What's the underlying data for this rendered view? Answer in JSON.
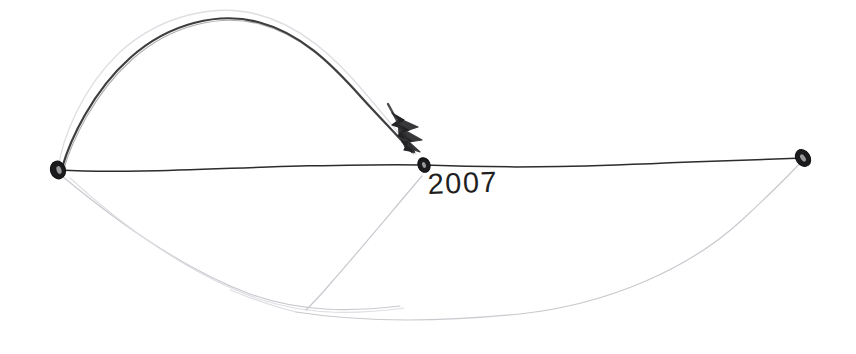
{
  "canvas": {
    "width": 856,
    "height": 354,
    "background_color": "#ffffff",
    "medium": "pencil-on-paper-scan"
  },
  "palette": {
    "ink_dark": "#2c2c2e",
    "ink_mid": "#4a4a4e",
    "ink_faint": "#c9c9cf",
    "ink_very_faint": "#dedee3",
    "node_fill": "#1b1b1d",
    "paper": "#ffffff"
  },
  "annotations": {
    "year_label": "2007"
  },
  "nodes": [
    {
      "name": "left-endpoint",
      "label": "",
      "x": 58,
      "y": 170
    },
    {
      "name": "middle-endpoint",
      "label": "2007",
      "x": 424,
      "y": 165
    },
    {
      "name": "right-endpoint",
      "label": "",
      "x": 803,
      "y": 158
    }
  ],
  "marks": {
    "arrowhead": {
      "name": "arrowhead-marker",
      "tip_x": 424,
      "tip_y": 160,
      "tail_x": 396,
      "tail_y": 112
    }
  },
  "paths": {
    "baseline_left": "M58,170 C130,174 220,168 300,166 C350,165 395,164 424,165",
    "baseline_right": "M424,165 C520,169 600,166 690,162 C740,160 775,159 803,158",
    "arc_dark": "M62,168 C70,140 92,92 130,58 C170,22 220,12 258,22 C300,33 330,62 362,98 C382,120 398,136 412,152",
    "arc_ghost": "M58,170 C62,138 82,88 120,52 C162,14 216,4 256,14 C300,25 334,56 366,94 C388,120 404,140 416,154",
    "lower_left_a": "M62,176 C110,216 180,268 250,294 C300,312 350,312 400,306",
    "lower_left_b": "M70,178 C120,224 190,276 262,300 C312,316 360,314 404,308",
    "valley_line": "M422,176 C398,204 360,250 330,284 C320,296 312,304 306,310",
    "lower_sweep": "M296,312 C360,322 440,322 520,314 C610,304 690,268 742,220 C772,192 792,172 801,162",
    "lower_sweep_tail": "M230,290 C260,302 280,308 296,312"
  },
  "stroke_widths": {
    "baseline": 1.5,
    "arc_dark": 2.2,
    "arc_ghost": 1.3,
    "faint": 1.2,
    "very_faint": 1.1
  }
}
